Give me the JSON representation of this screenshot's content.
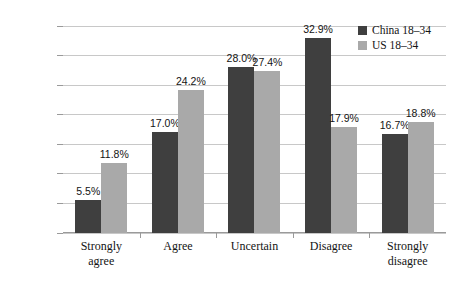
{
  "chart_data": {
    "type": "bar",
    "title": "",
    "subtitle": "",
    "xlabel": "",
    "ylabel": "",
    "ylim": [
      0,
      35
    ],
    "ytick_step": 5,
    "ytick_labels": [
      "0.0%",
      "5.0%",
      "10.0%",
      "15.0%",
      "20.0%",
      "25.0%",
      "30.0%",
      "35.0%"
    ],
    "grid": "horizontal",
    "legend_position": "top-right-inside",
    "categories": [
      "Strongly agree",
      "Agree",
      "Uncertain",
      "Disagree",
      "Strongly disagree"
    ],
    "category_lines": [
      [
        "Strongly",
        "agree"
      ],
      [
        "Agree"
      ],
      [
        "Uncertain"
      ],
      [
        "Disagree"
      ],
      [
        "Strongly",
        "disagree"
      ]
    ],
    "series": [
      {
        "name": "China 18–34",
        "color": "#3f3f3f",
        "values": [
          5.5,
          17.0,
          28.0,
          32.9,
          16.7
        ],
        "labels": [
          "5.5%",
          "17.0%",
          "28.0%",
          "32.9%",
          "16.7%"
        ]
      },
      {
        "name": "US 18–34",
        "color": "#a9a9a9",
        "values": [
          11.8,
          24.2,
          27.4,
          17.9,
          18.8
        ],
        "labels": [
          "11.8%",
          "24.2%",
          "27.4%",
          "17.9%",
          "18.8%"
        ]
      }
    ]
  },
  "colors": {
    "china": "#3f3f3f",
    "us": "#a9a9a9",
    "gridline": "#c8c8c8",
    "axis": "#9a9a9a",
    "background": "#ffffff",
    "text": "#141414"
  }
}
